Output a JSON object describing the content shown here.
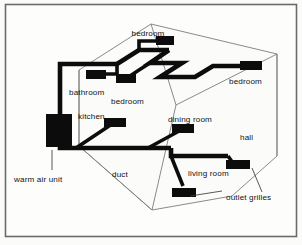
{
  "figure": {
    "kind": "isometric-floorplan-diagram",
    "background_color": "#fbfbfa",
    "ink_color": "#0c0c0c",
    "outline_color": "#7d7d7d",
    "frame_color": "#6b6b6b"
  },
  "labels": {
    "bedroom_top": "bedroom",
    "bedroom_right": "bedroom",
    "bedroom_mid": "bedroom",
    "bathroom": "bathroom",
    "kitchen": "kitchen",
    "dining_room": "dining room",
    "hall": "hall",
    "living_room": "living room",
    "duct": "duct",
    "warm_air_unit": "warm air unit",
    "outlet_grilles": "outlet grilles"
  },
  "rooms": [
    {
      "name": "bedroom",
      "position": "top-centre"
    },
    {
      "name": "bedroom",
      "position": "right"
    },
    {
      "name": "bedroom",
      "position": "centre-left"
    },
    {
      "name": "bathroom",
      "position": "left-upper"
    },
    {
      "name": "kitchen",
      "position": "left-lower"
    },
    {
      "name": "dining room",
      "position": "centre"
    },
    {
      "name": "hall",
      "position": "right-lower"
    },
    {
      "name": "living room",
      "position": "bottom-centre"
    }
  ],
  "callouts": [
    {
      "label": "warm air unit",
      "points_to": "black plenum box at left wall"
    },
    {
      "label": "duct",
      "points_to": "main distribution trunk"
    },
    {
      "label": "outlet grilles",
      "points_to": "terminal grille bars"
    }
  ],
  "counts": {
    "outlet_grilles": 8,
    "warm_air_units": 1,
    "labelled_rooms": 8
  }
}
